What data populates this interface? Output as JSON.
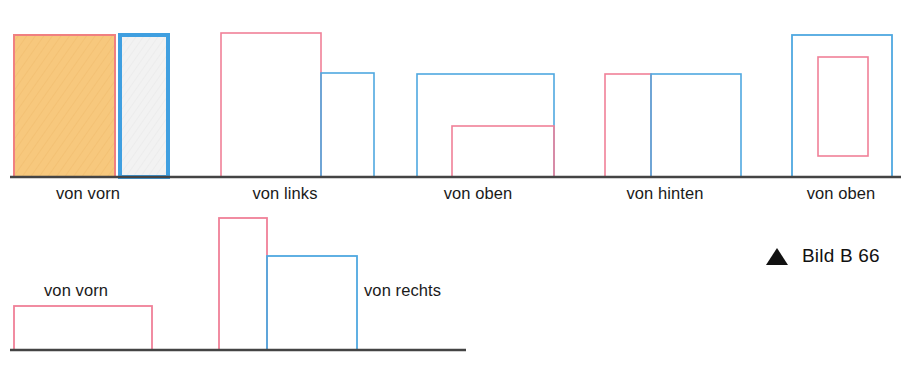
{
  "figure": {
    "caption": {
      "marker_icon": "triangle-up-icon",
      "text": "Bild B 66"
    },
    "colors": {
      "pink_stroke": "#F08098",
      "blue_stroke": "#4FA8E0",
      "orange_fill": "#F7C87D",
      "orange_stroke": "#F08080",
      "light_gray_fill": "#EDEDED",
      "ground_line": "#444444",
      "label_text": "#1a1a1a"
    },
    "ground_lines": [
      {
        "name": "upper-ground-line",
        "x1": 10,
        "y1": 177,
        "x2": 901,
        "y2": 177
      },
      {
        "name": "lower-ground-line",
        "x1": 10,
        "y1": 350,
        "x2": 466,
        "y2": 350
      }
    ],
    "groups": [
      {
        "id": "group-1",
        "label": "von vorn",
        "label_x": 88,
        "label_y": 184,
        "shapes": [
          {
            "name": "orange-filled-rect",
            "x": 14,
            "y": 35,
            "w": 101,
            "h": 142,
            "stroke": "#F08080",
            "fill": "#F7C87D",
            "stroke_width": 2
          },
          {
            "name": "blue-outlined-rect",
            "x": 120,
            "y": 35,
            "w": 48,
            "h": 142,
            "stroke": "#3F9FE0",
            "fill": "#EDEDED",
            "stroke_width": 4
          }
        ]
      },
      {
        "id": "group-2",
        "label": "von links",
        "label_x": 285,
        "label_y": 184,
        "shapes": [
          {
            "name": "pink-tall-rect",
            "x": 221,
            "y": 33,
            "w": 100,
            "h": 144,
            "stroke": "#F08098",
            "fill": "none",
            "stroke_width": 1.6
          },
          {
            "name": "blue-short-rect",
            "x": 321,
            "y": 73,
            "w": 53,
            "h": 104,
            "stroke": "#4FA8E0",
            "fill": "none",
            "stroke_width": 1.6
          }
        ]
      },
      {
        "id": "group-3",
        "label": "von oben",
        "label_x": 478,
        "label_y": 184,
        "shapes": [
          {
            "name": "blue-wide-rect",
            "x": 417,
            "y": 74,
            "w": 137,
            "h": 103,
            "stroke": "#4FA8E0",
            "fill": "none",
            "stroke_width": 1.6
          },
          {
            "name": "pink-lower-rect",
            "x": 452,
            "y": 126,
            "w": 102,
            "h": 51,
            "stroke": "#F08098",
            "fill": "none",
            "stroke_width": 1.6
          }
        ]
      },
      {
        "id": "group-4",
        "label": "von hinten",
        "label_x": 665,
        "label_y": 184,
        "shapes": [
          {
            "name": "pink-left-rect",
            "x": 605,
            "y": 74,
            "w": 46,
            "h": 103,
            "stroke": "#F08098",
            "fill": "none",
            "stroke_width": 1.6
          },
          {
            "name": "blue-right-rect",
            "x": 651,
            "y": 74,
            "w": 90,
            "h": 103,
            "stroke": "#4FA8E0",
            "fill": "none",
            "stroke_width": 1.6
          }
        ]
      },
      {
        "id": "group-5",
        "label": "von oben",
        "label_x": 841,
        "label_y": 184,
        "shapes": [
          {
            "name": "blue-outer-rect",
            "x": 792,
            "y": 35,
            "w": 100,
            "h": 142,
            "stroke": "#4FA8E0",
            "fill": "none",
            "stroke_width": 1.8
          },
          {
            "name": "pink-inner-rect",
            "x": 818,
            "y": 57,
            "w": 50,
            "h": 99,
            "stroke": "#F08098",
            "fill": "none",
            "stroke_width": 1.6
          }
        ]
      },
      {
        "id": "group-6",
        "label": "von vorn",
        "label_x": 44,
        "label_y": 281,
        "label_align": "left",
        "shapes": [
          {
            "name": "pink-flat-rect",
            "x": 14,
            "y": 306,
            "w": 138,
            "h": 44,
            "stroke": "#F08098",
            "fill": "none",
            "stroke_width": 1.8
          }
        ]
      },
      {
        "id": "group-7",
        "label": "von rechts",
        "label_x": 364,
        "label_y": 281,
        "label_align": "left",
        "shapes": [
          {
            "name": "pink-tall-rect",
            "x": 219,
            "y": 218,
            "w": 48,
            "h": 132,
            "stroke": "#F08098",
            "fill": "none",
            "stroke_width": 1.8
          },
          {
            "name": "blue-wide-rect",
            "x": 267,
            "y": 256,
            "w": 90,
            "h": 94,
            "stroke": "#4FA8E0",
            "fill": "none",
            "stroke_width": 1.8
          }
        ]
      }
    ]
  }
}
